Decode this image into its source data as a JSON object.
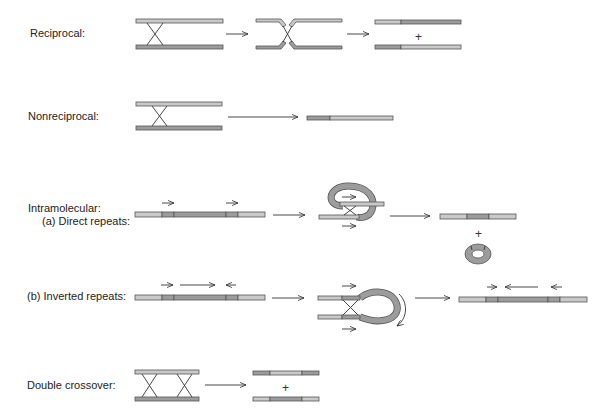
{
  "labels": {
    "reciprocal": "Reciprocal:",
    "nonreciprocal": "Nonreciprocal:",
    "intramolecular": "Intramolecular:",
    "direct_repeats": "(a) Direct repeats:",
    "inverted_repeats": "(b) Inverted repeats:",
    "double_crossover": "Double crossover:"
  },
  "symbols": {
    "plus": "+"
  },
  "colors": {
    "light_strand": "#c9c9c9",
    "dark_strand": "#9c9c9c",
    "outline": "#555555",
    "arrow": "#333333"
  }
}
